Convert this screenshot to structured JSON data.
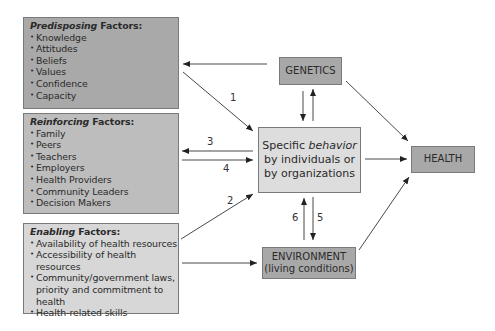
{
  "diagram": {
    "predisposing": {
      "title_italic": "Predisposing",
      "title_rest": " Factors:",
      "items": [
        "Knowledge",
        "Attitudes",
        "Beliefs",
        "Values",
        "Confidence",
        "Capacity"
      ]
    },
    "reinforcing": {
      "title_italic": "Reinforcing",
      "title_rest": " Factors:",
      "items": [
        "Family",
        "Peers",
        "Teachers",
        "Employers",
        "Health Providers",
        "Community Leaders",
        "Decision Makers"
      ]
    },
    "enabling": {
      "title_italic": "Enabling",
      "title_rest": " Factors:",
      "items": [
        "Availability of health resources",
        "Accessibility of health resources",
        "Community/government laws, priority and commitment to health",
        "Health-related skills"
      ]
    },
    "genetics": {
      "label": "GENETICS"
    },
    "behavior": {
      "line1_pre": "Specific ",
      "line1_italic": "behavior",
      "line2": "by individuals or",
      "line3": "by organizations"
    },
    "environment": {
      "line1": "ENVIRONMENT",
      "line2": "(living conditions)"
    },
    "health": {
      "label": "HEALTH"
    },
    "arrow_labels": {
      "a1": "1",
      "a2": "2",
      "a3": "3",
      "a4": "4",
      "a5": "5",
      "a6": "6"
    },
    "colors": {
      "predisposing": "#a9a9a9",
      "reinforcing": "#bdbdbd",
      "enabling": "#d7d7d7",
      "dark_boxes": "#a8a8a8",
      "behavior": "#dddddd"
    }
  }
}
